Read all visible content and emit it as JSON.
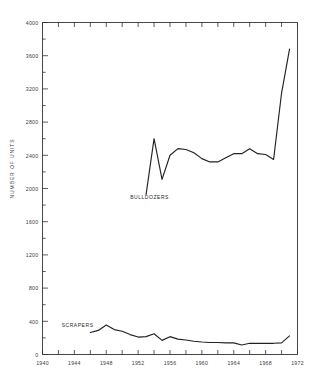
{
  "chart_data": {
    "type": "line",
    "title": "",
    "xlabel": "",
    "ylabel": "NUMBER OF UNITS",
    "xlim": [
      1940,
      1972
    ],
    "ylim": [
      0,
      4000
    ],
    "grid": false,
    "legend_position": "inline-annotation",
    "x_ticks_major": [
      1940,
      1944,
      1948,
      1952,
      1956,
      1960,
      1964,
      1968,
      1972
    ],
    "x_tick_labels": [
      "1940",
      "1944",
      "1948",
      "1952",
      "1956",
      "1960",
      "1964",
      "1968",
      "1972"
    ],
    "x_tick_interval_minor": 2,
    "y_ticks_major": [
      0,
      400,
      800,
      1200,
      1600,
      2000,
      2400,
      2800,
      3200,
      3600,
      4000
    ],
    "y_tick_labels": [
      "0",
      "400",
      "800",
      "1200",
      "1600",
      "2000",
      "2400",
      "2800",
      "3200",
      "3600",
      "4000"
    ],
    "y_tick_interval_minor": 200,
    "series": [
      {
        "name": "BULLDOZERS",
        "label_x": 1951.0,
        "label_y": 1870,
        "color": "#222222",
        "x": [
          1953,
          1954,
          1955,
          1956,
          1957,
          1958,
          1959,
          1960,
          1961,
          1962,
          1963,
          1964,
          1965,
          1966,
          1967,
          1968,
          1969,
          1970,
          1971
        ],
        "values": [
          1930,
          2600,
          2110,
          2400,
          2480,
          2470,
          2430,
          2360,
          2320,
          2320,
          2370,
          2420,
          2420,
          2480,
          2420,
          2410,
          2350,
          3150,
          3680
        ]
      },
      {
        "name": "SCRAPERS",
        "label_x": 1942.4,
        "label_y": 330,
        "color": "#222222",
        "x": [
          1946,
          1947,
          1948,
          1949,
          1950,
          1951,
          1952,
          1953,
          1954,
          1955,
          1956,
          1957,
          1958,
          1959,
          1960,
          1961,
          1962,
          1963,
          1964,
          1965,
          1966,
          1967,
          1968,
          1969,
          1970,
          1971
        ],
        "values": [
          265,
          290,
          355,
          300,
          280,
          240,
          210,
          215,
          250,
          170,
          215,
          185,
          175,
          160,
          150,
          145,
          145,
          140,
          140,
          115,
          135,
          135,
          135,
          135,
          140,
          225
        ]
      }
    ],
    "annotations": [
      {
        "text": "BULLDOZERS",
        "x": 1951.0,
        "y": 1870
      },
      {
        "text": "SCRAPERS",
        "x": 1942.4,
        "y": 330
      }
    ],
    "axis_color": "#333333",
    "line_color": "#222222"
  },
  "top_faint_text": ""
}
